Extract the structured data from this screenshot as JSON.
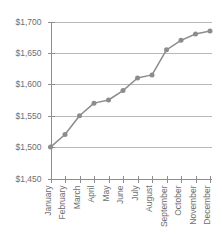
{
  "chart_data": {
    "type": "line",
    "title": "",
    "subtitle": "",
    "xlabel": "",
    "ylabel": "",
    "categories": [
      "January",
      "February",
      "March",
      "April",
      "May",
      "June",
      "July",
      "August",
      "September",
      "October",
      "November",
      "December"
    ],
    "values": [
      1500,
      1520,
      1550,
      1570,
      1575,
      1590,
      1610,
      1615,
      1655,
      1670,
      1680,
      1685
    ],
    "series": [
      {
        "name": "",
        "values": [
          1500,
          1520,
          1550,
          1570,
          1575,
          1590,
          1610,
          1615,
          1655,
          1670,
          1680,
          1685
        ]
      }
    ],
    "ylim": [
      1450,
      1700
    ],
    "ytick_values": [
      1450,
      1500,
      1550,
      1600,
      1650,
      1700
    ],
    "ytick_labels": [
      "$1,450",
      "$1,500",
      "$1,550",
      "$1,600",
      "$1,650",
      "$1,700"
    ],
    "ytick_prefix": "$",
    "ytick_step": 50,
    "grid": {
      "horizontal": true,
      "vertical": false
    },
    "legend": {
      "visible": false,
      "position": "none",
      "entries": []
    },
    "annotations": [],
    "markers": "circle",
    "xtick_label_rotation": -90,
    "colors": {
      "line": "#8c8c8c",
      "marker": "#8c8c8c",
      "gridline": "#9a9a9a",
      "axis": "#8e8e8e",
      "tick_text": "#6e6e6e",
      "background": "#ffffff"
    }
  }
}
